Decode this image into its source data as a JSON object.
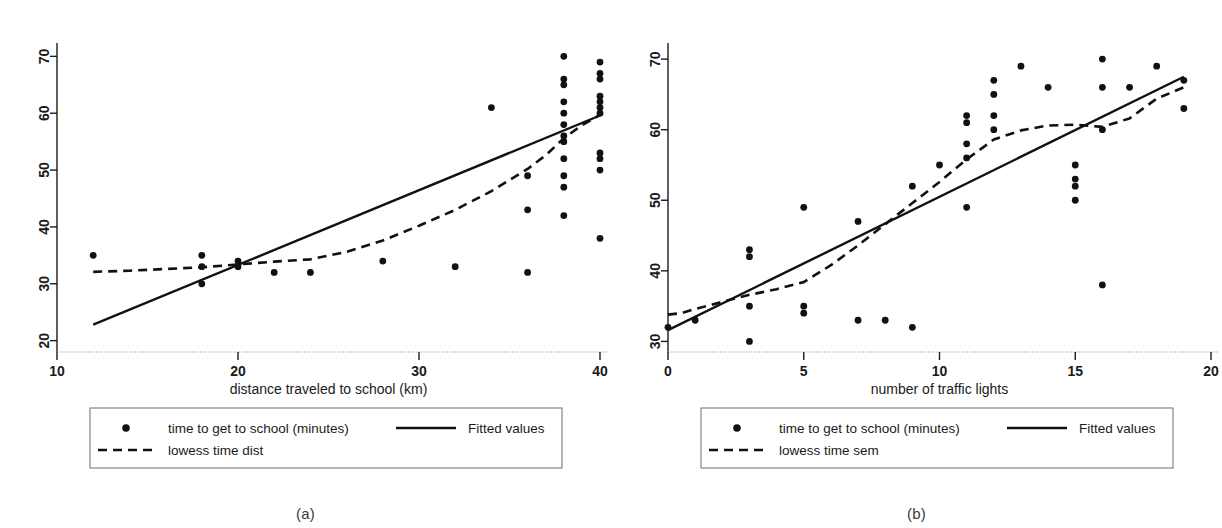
{
  "figure": {
    "panels": [
      {
        "caption": "(a)",
        "chart_data": {
          "type": "scatter",
          "title": "",
          "xlabel": "distance traveled to school (km)",
          "ylabel": "",
          "xlim": [
            10,
            40
          ],
          "ylim": [
            18,
            72
          ],
          "xticks": [
            10,
            20,
            30,
            40
          ],
          "yticks": [
            20,
            30,
            40,
            50,
            60,
            70
          ],
          "grid": false,
          "legend_position": "below-axis",
          "series": [
            {
              "name": "time to get to school (minutes)",
              "type": "scatter",
              "marker": "filled-circle",
              "points": [
                [
                  12,
                  35
                ],
                [
                  18,
                  35
                ],
                [
                  18,
                  33
                ],
                [
                  18,
                  30
                ],
                [
                  20,
                  34
                ],
                [
                  20,
                  33
                ],
                [
                  22,
                  32
                ],
                [
                  24,
                  32
                ],
                [
                  28,
                  34
                ],
                [
                  32,
                  33
                ],
                [
                  34,
                  61
                ],
                [
                  36,
                  49
                ],
                [
                  36,
                  43
                ],
                [
                  36,
                  32
                ],
                [
                  38,
                  70
                ],
                [
                  38,
                  66
                ],
                [
                  38,
                  65
                ],
                [
                  38,
                  62
                ],
                [
                  38,
                  60
                ],
                [
                  38,
                  58
                ],
                [
                  38,
                  56
                ],
                [
                  38,
                  55
                ],
                [
                  38,
                  52
                ],
                [
                  38,
                  49
                ],
                [
                  38,
                  47
                ],
                [
                  38,
                  42
                ],
                [
                  40,
                  69
                ],
                [
                  40,
                  67
                ],
                [
                  40,
                  66
                ],
                [
                  40,
                  63
                ],
                [
                  40,
                  62
                ],
                [
                  40,
                  61
                ],
                [
                  40,
                  60
                ],
                [
                  40,
                  53
                ],
                [
                  40,
                  52
                ],
                [
                  40,
                  50
                ],
                [
                  40,
                  38
                ]
              ]
            },
            {
              "name": "Fitted values",
              "type": "line",
              "style": "solid",
              "points": [
                [
                  12,
                  22.8
                ],
                [
                  40,
                  59.6
                ]
              ]
            },
            {
              "name": "lowess time dist",
              "type": "line",
              "style": "dashed",
              "points": [
                [
                  12,
                  32.1
                ],
                [
                  14,
                  32.3
                ],
                [
                  16,
                  32.6
                ],
                [
                  18,
                  32.9
                ],
                [
                  20,
                  33.4
                ],
                [
                  22,
                  33.9
                ],
                [
                  24,
                  34.3
                ],
                [
                  26,
                  35.6
                ],
                [
                  28,
                  37.6
                ],
                [
                  30,
                  40.2
                ],
                [
                  32,
                  43.0
                ],
                [
                  34,
                  46.3
                ],
                [
                  36,
                  50.2
                ],
                [
                  37,
                  52.6
                ],
                [
                  38,
                  55.6
                ],
                [
                  39,
                  57.9
                ],
                [
                  40,
                  59.7
                ]
              ]
            }
          ],
          "legend": [
            {
              "label": "time to get to school (minutes)",
              "marker": "filled-circle"
            },
            {
              "label": "Fitted values",
              "marker": "solid-line"
            },
            {
              "label": "lowess time dist",
              "marker": "dashed-line"
            }
          ]
        }
      },
      {
        "caption": "(b)",
        "chart_data": {
          "type": "scatter",
          "title": "",
          "xlabel": "number of traffic lights",
          "ylabel": "",
          "xlim": [
            0,
            20
          ],
          "ylim": [
            28.5,
            72
          ],
          "xticks": [
            0,
            5,
            10,
            15,
            20
          ],
          "yticks": [
            30,
            40,
            50,
            60,
            70
          ],
          "grid": false,
          "legend_position": "below-axis",
          "series": [
            {
              "name": "time to get to school (minutes)",
              "type": "scatter",
              "marker": "filled-circle",
              "points": [
                [
                  0,
                  32
                ],
                [
                  1,
                  33
                ],
                [
                  3,
                  43
                ],
                [
                  3,
                  42
                ],
                [
                  3,
                  35
                ],
                [
                  3,
                  30
                ],
                [
                  5,
                  49
                ],
                [
                  5,
                  35
                ],
                [
                  5,
                  34
                ],
                [
                  7,
                  47
                ],
                [
                  7,
                  33
                ],
                [
                  8,
                  33
                ],
                [
                  9,
                  52
                ],
                [
                  9,
                  32
                ],
                [
                  10,
                  55
                ],
                [
                  11,
                  62
                ],
                [
                  11,
                  61
                ],
                [
                  11,
                  58
                ],
                [
                  11,
                  56
                ],
                [
                  11,
                  49
                ],
                [
                  12,
                  67
                ],
                [
                  12,
                  65
                ],
                [
                  12,
                  62
                ],
                [
                  12,
                  60
                ],
                [
                  13,
                  69
                ],
                [
                  14,
                  66
                ],
                [
                  15,
                  55
                ],
                [
                  15,
                  53
                ],
                [
                  15,
                  52
                ],
                [
                  15,
                  50
                ],
                [
                  16,
                  70
                ],
                [
                  16,
                  66
                ],
                [
                  16,
                  60
                ],
                [
                  16,
                  38
                ],
                [
                  17,
                  66
                ],
                [
                  18,
                  69
                ],
                [
                  19,
                  67
                ],
                [
                  19,
                  63
                ]
              ]
            },
            {
              "name": "Fitted values",
              "type": "line",
              "style": "solid",
              "points": [
                [
                  0,
                  31.6
                ],
                [
                  19,
                  67.5
                ]
              ]
            },
            {
              "name": "lowess time sem",
              "type": "line",
              "style": "dashed",
              "points": [
                [
                  0,
                  33.8
                ],
                [
                  0.5,
                  34.0
                ],
                [
                  1,
                  34.6
                ],
                [
                  2,
                  35.6
                ],
                [
                  3,
                  36.6
                ],
                [
                  4,
                  37.4
                ],
                [
                  5,
                  38.4
                ],
                [
                  6,
                  40.8
                ],
                [
                  7,
                  43.6
                ],
                [
                  8,
                  46.6
                ],
                [
                  9,
                  49.6
                ],
                [
                  10,
                  52.6
                ],
                [
                  11,
                  55.8
                ],
                [
                  12,
                  58.6
                ],
                [
                  13,
                  59.9
                ],
                [
                  14,
                  60.6
                ],
                [
                  15,
                  60.7
                ],
                [
                  16,
                  60.4
                ],
                [
                  17,
                  61.6
                ],
                [
                  18,
                  64.4
                ],
                [
                  19,
                  66.0
                ]
              ]
            }
          ],
          "legend": [
            {
              "label": "time to get to school (minutes)",
              "marker": "filled-circle"
            },
            {
              "label": "Fitted values",
              "marker": "solid-line"
            },
            {
              "label": "lowess time sem",
              "marker": "dashed-line"
            }
          ]
        }
      }
    ]
  }
}
